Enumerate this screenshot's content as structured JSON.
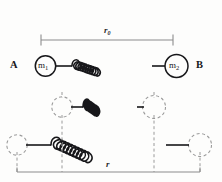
{
  "figure": {
    "background_color": "#fdfdfc",
    "stroke_color": "#17171a",
    "dimension_line_color": "#8c8c8c",
    "dashed_color": "#9a9a9a",
    "labels": {
      "left_end": "A",
      "right_end": "B",
      "mass_one": "m",
      "mass_one_sub": "1",
      "mass_two": "m",
      "mass_two_sub": "2",
      "equilibrium_distance": "r",
      "equilibrium_distance_sub": "0",
      "separation_distance": "r"
    },
    "rows": [
      {
        "name": "equilibrium-row",
        "description": "Mass m1 at left joined by relaxed spring to mass m2 at right, labelled A and B, spanned by dimension r0.",
        "spring_coils": 10,
        "state": "equilibrium"
      },
      {
        "name": "compressed-row",
        "description": "Dashed outline masses with a compressed spring between them.",
        "spring_coils": 10,
        "state": "compressed"
      },
      {
        "name": "stretched-row",
        "description": "Dashed outline masses moved apart with a stretched spring, spanned by dimension r.",
        "spring_coils": 10,
        "state": "stretched"
      }
    ]
  }
}
